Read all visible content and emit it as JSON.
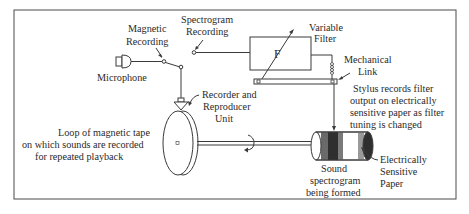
{
  "diagram": {
    "type": "block schematic",
    "colors": {
      "line": "#3a3a3a",
      "background": "#ffffff",
      "border": "#4a4a4a",
      "band_dark": "#2f2f2f",
      "band_mid": "#7a7a7a"
    },
    "labels": {
      "magnetic_recording": [
        "Magnetic",
        "Recording"
      ],
      "spectrogram_recording": [
        "Spectrogram",
        "Recording"
      ],
      "microphone": "Microphone",
      "variable_filter": [
        "Variable",
        "Filter"
      ],
      "filter_symbol": "F",
      "mechanical_link": [
        "Mechanical",
        "Link"
      ],
      "stylus_note": [
        "Stylus records filter",
        "output on electrically",
        "sensitive paper as filter",
        "tuning is changed"
      ],
      "recorder_reproducer": [
        "Recorder and",
        "Reproducer",
        "Unit"
      ],
      "tape_loop": [
        "Loop of magnetic tape",
        "on which sounds are recorded",
        "for repeated playback"
      ],
      "electrically_sensitive_paper": [
        "Electrically",
        "Sensitive",
        "Paper"
      ],
      "sound_spectrogram": [
        "Sound",
        "spectrogram",
        "being formed"
      ]
    },
    "components": [
      {
        "id": "microphone",
        "icon": "microphone-icon"
      },
      {
        "id": "switch",
        "positions": [
          "Magnetic Recording",
          "Spectrogram Recording"
        ]
      },
      {
        "id": "recorder-reproducer-head",
        "icon": "head-icon"
      },
      {
        "id": "tape-loop-disk",
        "icon": "disk-icon"
      },
      {
        "id": "shaft",
        "icon": "rotation-arrow-icon"
      },
      {
        "id": "variable-filter",
        "icon": "filter-box"
      },
      {
        "id": "mechanical-link",
        "icon": "link-bar"
      },
      {
        "id": "drum",
        "icon": "drum-icon"
      }
    ]
  }
}
